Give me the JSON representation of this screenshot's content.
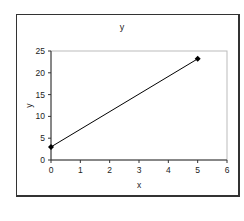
{
  "chart_data": {
    "type": "line",
    "title": "y",
    "xlabel": "x",
    "ylabel": "y",
    "x": [
      0,
      5
    ],
    "series": [
      {
        "name": "y",
        "values": [
          3,
          23.2
        ],
        "marker": "diamond",
        "color": "#000000"
      }
    ],
    "xlim": [
      0,
      6
    ],
    "ylim": [
      0,
      25
    ],
    "xticks": [
      "0",
      "1",
      "2",
      "3",
      "4",
      "5",
      "6"
    ],
    "yticks": [
      "0",
      "5",
      "10",
      "15",
      "20",
      "25"
    ],
    "grid": false,
    "legend": "none"
  }
}
